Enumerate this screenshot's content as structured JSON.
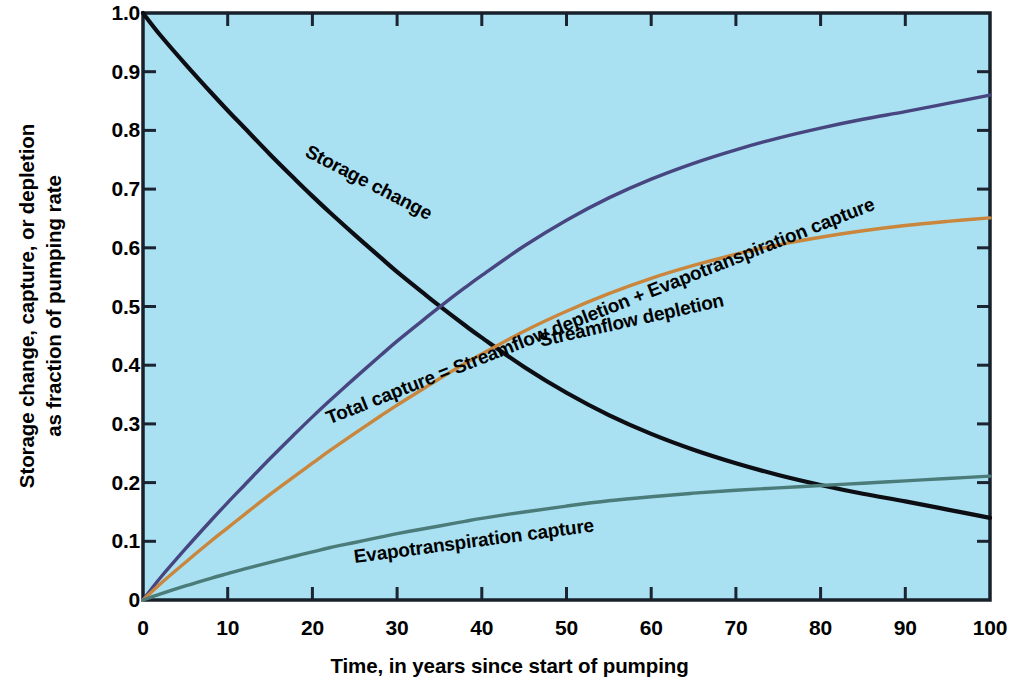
{
  "chart_data": {
    "type": "line",
    "title": "",
    "xlabel": "Time, in years since start of pumping",
    "ylabel_line1": "Storage change, capture, or depletion",
    "ylabel_line2": "as fraction of pumping rate",
    "xlim": [
      0,
      100
    ],
    "ylim": [
      0,
      1.0
    ],
    "grid": false,
    "legend": "inline-curve-labels",
    "xticks": [
      "0",
      "10",
      "20",
      "30",
      "40",
      "50",
      "60",
      "70",
      "80",
      "90",
      "100"
    ],
    "xtick_values": [
      0,
      10,
      20,
      30,
      40,
      50,
      60,
      70,
      80,
      90,
      100
    ],
    "yticks": [
      "0",
      "0.1",
      "0.2",
      "0.3",
      "0.4",
      "0.5",
      "0.6",
      "0.7",
      "0.8",
      "0.9",
      "1.0"
    ],
    "ytick_values": [
      0,
      0.1,
      0.2,
      0.3,
      0.4,
      0.5,
      0.6,
      0.7,
      0.8,
      0.9,
      1.0
    ],
    "plot_background": "#a9e1f2",
    "x": [
      0,
      2,
      5,
      8,
      10,
      12,
      15,
      18,
      20,
      22,
      25,
      28,
      30,
      33,
      35,
      38,
      40,
      45,
      50,
      55,
      60,
      65,
      70,
      75,
      80,
      85,
      90,
      95,
      100
    ],
    "series": [
      {
        "name": "Storage change",
        "label": "Storage change",
        "color": "#0d0d14",
        "values": [
          1.0,
          0.963,
          0.913,
          0.865,
          0.834,
          0.804,
          0.759,
          0.716,
          0.688,
          0.661,
          0.622,
          0.584,
          0.559,
          0.524,
          0.501,
          0.468,
          0.447,
          0.397,
          0.353,
          0.315,
          0.283,
          0.256,
          0.233,
          0.213,
          0.196,
          0.181,
          0.168,
          0.154,
          0.14
        ]
      },
      {
        "name": "Total capture",
        "label": "Total capture = Streamflow depletion + Evapotranspiration capture",
        "color": "#474680",
        "values": [
          0.0,
          0.037,
          0.087,
          0.135,
          0.166,
          0.196,
          0.241,
          0.284,
          0.312,
          0.339,
          0.378,
          0.416,
          0.441,
          0.476,
          0.499,
          0.532,
          0.553,
          0.603,
          0.647,
          0.685,
          0.717,
          0.744,
          0.767,
          0.787,
          0.804,
          0.819,
          0.832,
          0.846,
          0.86
        ]
      },
      {
        "name": "Streamflow depletion",
        "label": "Streamflow depletion",
        "color": "#c9863c",
        "values": [
          0.0,
          0.027,
          0.064,
          0.1,
          0.123,
          0.146,
          0.18,
          0.212,
          0.233,
          0.254,
          0.284,
          0.313,
          0.332,
          0.359,
          0.377,
          0.403,
          0.419,
          0.458,
          0.492,
          0.522,
          0.548,
          0.57,
          0.589,
          0.605,
          0.618,
          0.629,
          0.638,
          0.645,
          0.651
        ]
      },
      {
        "name": "Evapotranspiration capture",
        "label": "Evapotranspiration capture",
        "color": "#4b7c7a",
        "values": [
          0.0,
          0.01,
          0.024,
          0.037,
          0.045,
          0.053,
          0.064,
          0.075,
          0.082,
          0.089,
          0.098,
          0.107,
          0.113,
          0.121,
          0.126,
          0.134,
          0.139,
          0.15,
          0.16,
          0.169,
          0.176,
          0.182,
          0.187,
          0.191,
          0.195,
          0.199,
          0.203,
          0.207,
          0.211
        ]
      }
    ]
  }
}
